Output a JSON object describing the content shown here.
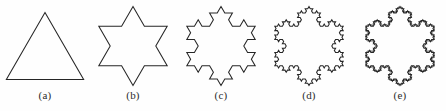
{
  "figure": {
    "background_color": "#fefefe",
    "stroke_color": "#262626",
    "label_color": "#2b2b2b"
  },
  "panels": [
    {
      "id": "panel-a",
      "label": "(a)",
      "iteration": 0,
      "shape_name": "equilateral-triangle",
      "segments": 3,
      "left": 2,
      "width": 86
    },
    {
      "id": "panel-b",
      "label": "(b)",
      "iteration": 1,
      "shape_name": "star-of-david",
      "segments": 12,
      "left": 90,
      "width": 86
    },
    {
      "id": "panel-c",
      "label": "(c)",
      "iteration": 2,
      "shape_name": "koch-snowflake-2",
      "segments": 48,
      "left": 178,
      "width": 86
    },
    {
      "id": "panel-d",
      "label": "(d)",
      "iteration": 3,
      "shape_name": "koch-snowflake-3",
      "segments": 192,
      "left": 266,
      "width": 86
    },
    {
      "id": "panel-e",
      "label": "(e)",
      "iteration": 4,
      "shape_name": "koch-snowflake-4",
      "segments": 768,
      "left": 357,
      "width": 86
    }
  ],
  "chart_data": {
    "type": "diagram",
    "stages": [
      {
        "label": "(a)",
        "iteration": 0,
        "edges": 3,
        "shape": "equilateral triangle"
      },
      {
        "label": "(b)",
        "iteration": 1,
        "edges": 12,
        "shape": "six-pointed star"
      },
      {
        "label": "(c)",
        "iteration": 2,
        "edges": 48,
        "shape": "koch snowflake stage 2"
      },
      {
        "label": "(d)",
        "iteration": 3,
        "edges": 192,
        "shape": "koch snowflake stage 3"
      },
      {
        "label": "(e)",
        "iteration": 4,
        "edges": 768,
        "shape": "koch snowflake stage 4"
      }
    ]
  }
}
